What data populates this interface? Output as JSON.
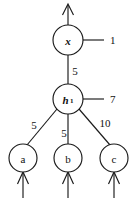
{
  "diagram": {
    "type": "neural-network-node-graph",
    "background_color": "#ffffff",
    "stroke_color": "#1a1a1a",
    "nodes": [
      {
        "id": "x",
        "label": "x",
        "subscript": "",
        "cx": 68,
        "cy": 40,
        "r": 15
      },
      {
        "id": "h1",
        "label": "h",
        "subscript": "1",
        "cx": 68,
        "cy": 99,
        "r": 15
      },
      {
        "id": "a",
        "label": "a",
        "subscript": "",
        "cx": 23,
        "cy": 158,
        "r": 14
      },
      {
        "id": "b",
        "label": "b",
        "subscript": "",
        "cx": 68,
        "cy": 158,
        "r": 14
      },
      {
        "id": "c",
        "label": "c",
        "subscript": "",
        "cx": 114,
        "cy": 158,
        "r": 14
      }
    ],
    "edges": [
      {
        "from": "h1",
        "to": "x",
        "weight": "5",
        "label_x": 75,
        "label_y": 71
      },
      {
        "from": "a",
        "to": "h1",
        "weight": "5",
        "label_x": 34,
        "label_y": 125
      },
      {
        "from": "b",
        "to": "h1",
        "weight": "5",
        "label_x": 64,
        "label_y": 133
      },
      {
        "from": "c",
        "to": "h1",
        "weight": "10",
        "label_x": 105,
        "label_y": 123
      }
    ],
    "side_labels": [
      {
        "for": "x",
        "text": "1",
        "x": 110,
        "y": 40
      },
      {
        "for": "h1",
        "text": "7",
        "x": 110,
        "y": 99
      }
    ],
    "arrows": [
      {
        "name": "output-arrow",
        "x": 68,
        "from_y": 25,
        "to_y": 4
      },
      {
        "name": "input-arrow-a",
        "x": 23,
        "from_y": 198,
        "to_y": 172
      },
      {
        "name": "input-arrow-b",
        "x": 68,
        "from_y": 198,
        "to_y": 172
      },
      {
        "name": "input-arrow-c",
        "x": 114,
        "from_y": 198,
        "to_y": 172
      }
    ]
  }
}
